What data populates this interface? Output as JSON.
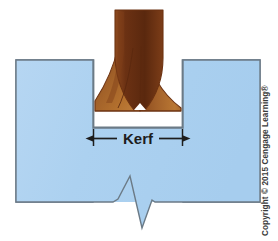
{
  "figure": {
    "caption_label": "Kerf",
    "copyright": "Copyright © 2015 Cengage Learning®",
    "colors": {
      "workpiece_fill": "#aed2f0",
      "workpiece_fill_light": "#c4dff5",
      "workpiece_outline": "#6b7a86",
      "flame_dark": "#5d2a0f",
      "flame_mid": "#8a4418",
      "flame_light": "#bd7a38",
      "flame_outline": "#6d3312",
      "background": "#ffffff",
      "dimension_line": "#1d1d1d",
      "label_text": "#1d1d1d",
      "copyright_text": "#3b3b3b"
    },
    "geometry": {
      "canvas_width": 278,
      "canvas_height": 241,
      "left_block": {
        "x": 16,
        "y": 60,
        "width": 77,
        "height": 142
      },
      "right_block": {
        "x": 183,
        "y": 60,
        "width": 77,
        "height": 142
      },
      "groove": {
        "left_x": 93,
        "right_x": 183,
        "top_y": 60,
        "bottom_y": 128
      },
      "flame": {
        "top_y": 10,
        "top_left_x": 115,
        "top_right_x": 163,
        "bottom_y": 112
      },
      "break_line": {
        "left_x": 16,
        "right_x": 260,
        "base_y": 202,
        "peak_y": 176,
        "valley_y": 236
      },
      "dimension": {
        "y": 138,
        "left_x": 93,
        "right_x": 183,
        "tick_top_y": 130,
        "tick_bottom_y": 146
      }
    },
    "annotations": {
      "kerf_arrow_left": "arrow-left",
      "kerf_arrow_right": "arrow-right",
      "break_symbol": "zigzag-break-line"
    }
  }
}
